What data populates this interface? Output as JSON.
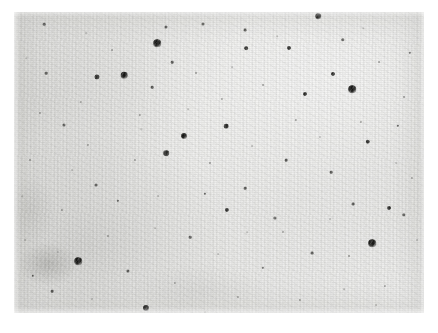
{
  "image": {
    "kind": "astronomical-photographic-plate-scan",
    "width": 438,
    "height": 333,
    "background_color": "#ffffff",
    "caption": ""
  },
  "plate": {
    "label": "photographic plate field",
    "x": 14,
    "y": 12,
    "width": 410,
    "height": 301,
    "base_tone": "#e9e9e7",
    "grain": "fine silver-halide grain",
    "border": "none"
  },
  "diffuse_features": [
    {
      "name": "low-surface-brightness-smudge",
      "cx": 48,
      "cy": 264,
      "rx": 30,
      "ry": 22,
      "tone": "rgba(110,110,105,0.30)"
    },
    {
      "name": "faint-halo-left",
      "cx": 30,
      "cy": 210,
      "rx": 26,
      "ry": 34,
      "tone": "rgba(125,125,120,0.15)"
    },
    {
      "name": "faint-haze-lower-center",
      "cx": 200,
      "cy": 290,
      "rx": 70,
      "ry": 26,
      "tone": "rgba(130,130,125,0.10)"
    }
  ],
  "spots": [
    {
      "x": 157,
      "y": 43,
      "d": 7.5,
      "class": "big"
    },
    {
      "x": 352,
      "y": 89,
      "d": 7.5,
      "class": "big"
    },
    {
      "x": 78,
      "y": 261,
      "d": 7.5,
      "class": "big"
    },
    {
      "x": 372,
      "y": 243,
      "d": 7.5,
      "class": "big"
    },
    {
      "x": 124,
      "y": 75,
      "d": 6.5,
      "class": "big"
    },
    {
      "x": 184,
      "y": 136,
      "d": 6.0,
      "class": "big"
    },
    {
      "x": 146,
      "y": 308,
      "d": 6.0,
      "class": "big"
    },
    {
      "x": 318,
      "y": 16,
      "d": 5.5,
      "class": "big"
    },
    {
      "x": 166,
      "y": 153,
      "d": 5.5,
      "class": "mid"
    },
    {
      "x": 97,
      "y": 77,
      "d": 5.0,
      "class": "mid"
    },
    {
      "x": 226,
      "y": 126,
      "d": 4.6,
      "class": "mid"
    },
    {
      "x": 368,
      "y": 142,
      "d": 4.4,
      "class": "mid"
    },
    {
      "x": 227,
      "y": 210,
      "d": 4.2,
      "class": "mid"
    },
    {
      "x": 289,
      "y": 48,
      "d": 4.0,
      "class": "mid"
    },
    {
      "x": 333,
      "y": 74,
      "d": 4.0,
      "class": "mid"
    },
    {
      "x": 305,
      "y": 94,
      "d": 4.0,
      "class": "mid"
    },
    {
      "x": 389,
      "y": 208,
      "d": 4.0,
      "class": "mid"
    },
    {
      "x": 246,
      "y": 48,
      "d": 3.6,
      "class": "mid"
    },
    {
      "x": 343,
      "y": 40,
      "d": 3.4,
      "class": "small"
    },
    {
      "x": 404,
      "y": 215,
      "d": 3.4,
      "class": "small"
    },
    {
      "x": 275,
      "y": 218,
      "d": 3.2,
      "class": "small"
    },
    {
      "x": 128,
      "y": 271,
      "d": 3.2,
      "class": "small"
    },
    {
      "x": 166,
      "y": 27,
      "d": 3.0,
      "class": "small"
    },
    {
      "x": 203,
      "y": 24,
      "d": 3.0,
      "class": "small"
    },
    {
      "x": 64,
      "y": 125,
      "d": 3.0,
      "class": "small"
    },
    {
      "x": 96,
      "y": 185,
      "d": 3.0,
      "class": "small"
    },
    {
      "x": 245,
      "y": 30,
      "d": 2.8,
      "class": "small"
    },
    {
      "x": 353,
      "y": 204,
      "d": 2.8,
      "class": "small"
    },
    {
      "x": 312,
      "y": 253,
      "d": 2.8,
      "class": "small"
    },
    {
      "x": 44,
      "y": 24,
      "d": 2.6,
      "class": "small"
    },
    {
      "x": 46,
      "y": 73,
      "d": 2.6,
      "class": "small"
    },
    {
      "x": 152,
      "y": 87,
      "d": 2.6,
      "class": "small"
    },
    {
      "x": 172,
      "y": 62,
      "d": 2.6,
      "class": "small"
    },
    {
      "x": 286,
      "y": 160,
      "d": 2.6,
      "class": "small"
    },
    {
      "x": 331,
      "y": 172,
      "d": 2.6,
      "class": "small"
    },
    {
      "x": 245,
      "y": 188,
      "d": 2.6,
      "class": "small"
    },
    {
      "x": 190,
      "y": 237,
      "d": 2.6,
      "class": "small"
    },
    {
      "x": 52,
      "y": 291,
      "d": 2.6,
      "class": "small"
    },
    {
      "x": 33,
      "y": 276,
      "d": 2.4,
      "class": "small"
    },
    {
      "x": 118,
      "y": 201,
      "d": 2.4,
      "class": "small"
    },
    {
      "x": 205,
      "y": 194,
      "d": 2.4,
      "class": "small"
    },
    {
      "x": 263,
      "y": 268,
      "d": 2.4,
      "class": "small"
    },
    {
      "x": 398,
      "y": 126,
      "d": 2.4,
      "class": "small"
    },
    {
      "x": 410,
      "y": 53,
      "d": 2.4,
      "class": "small"
    },
    {
      "x": 361,
      "y": 122,
      "d": 2.2,
      "class": "faint"
    },
    {
      "x": 296,
      "y": 120,
      "d": 2.2,
      "class": "faint"
    },
    {
      "x": 222,
      "y": 99,
      "d": 2.2,
      "class": "faint"
    },
    {
      "x": 140,
      "y": 115,
      "d": 2.2,
      "class": "faint"
    },
    {
      "x": 81,
      "y": 102,
      "d": 2.2,
      "class": "faint"
    },
    {
      "x": 62,
      "y": 210,
      "d": 2.2,
      "class": "faint"
    },
    {
      "x": 108,
      "y": 236,
      "d": 2.2,
      "class": "faint"
    },
    {
      "x": 175,
      "y": 283,
      "d": 2.2,
      "class": "faint"
    },
    {
      "x": 238,
      "y": 297,
      "d": 2.2,
      "class": "faint"
    },
    {
      "x": 300,
      "y": 300,
      "d": 2.2,
      "class": "faint"
    },
    {
      "x": 385,
      "y": 286,
      "d": 2.2,
      "class": "faint"
    },
    {
      "x": 412,
      "y": 178,
      "d": 2.2,
      "class": "faint"
    },
    {
      "x": 349,
      "y": 256,
      "d": 2.0,
      "class": "faint"
    },
    {
      "x": 283,
      "y": 232,
      "d": 2.0,
      "class": "faint"
    },
    {
      "x": 210,
      "y": 163,
      "d": 2.0,
      "class": "faint"
    },
    {
      "x": 135,
      "y": 160,
      "d": 2.0,
      "class": "faint"
    },
    {
      "x": 88,
      "y": 145,
      "d": 2.0,
      "class": "faint"
    },
    {
      "x": 30,
      "y": 160,
      "d": 2.0,
      "class": "faint"
    },
    {
      "x": 40,
      "y": 113,
      "d": 2.0,
      "class": "faint"
    },
    {
      "x": 112,
      "y": 50,
      "d": 2.0,
      "class": "faint"
    },
    {
      "x": 196,
      "y": 73,
      "d": 2.0,
      "class": "faint"
    },
    {
      "x": 263,
      "y": 85,
      "d": 2.0,
      "class": "faint"
    },
    {
      "x": 379,
      "y": 62,
      "d": 2.0,
      "class": "faint"
    },
    {
      "x": 404,
      "y": 97,
      "d": 2.0,
      "class": "faint"
    },
    {
      "x": 320,
      "y": 137,
      "d": 1.8,
      "class": "vfaint"
    },
    {
      "x": 252,
      "y": 146,
      "d": 1.8,
      "class": "vfaint"
    },
    {
      "x": 158,
      "y": 196,
      "d": 1.8,
      "class": "vfaint"
    },
    {
      "x": 72,
      "y": 170,
      "d": 1.8,
      "class": "vfaint"
    },
    {
      "x": 25,
      "y": 240,
      "d": 1.8,
      "class": "vfaint"
    },
    {
      "x": 58,
      "y": 252,
      "d": 1.8,
      "class": "vfaint"
    },
    {
      "x": 92,
      "y": 299,
      "d": 1.8,
      "class": "vfaint"
    },
    {
      "x": 218,
      "y": 254,
      "d": 1.8,
      "class": "vfaint"
    },
    {
      "x": 330,
      "y": 219,
      "d": 1.8,
      "class": "vfaint"
    },
    {
      "x": 396,
      "y": 163,
      "d": 1.8,
      "class": "vfaint"
    },
    {
      "x": 417,
      "y": 240,
      "d": 1.8,
      "class": "vfaint"
    },
    {
      "x": 376,
      "y": 305,
      "d": 1.8,
      "class": "vfaint"
    },
    {
      "x": 141,
      "y": 129,
      "d": 1.6,
      "class": "vfaint"
    },
    {
      "x": 188,
      "y": 109,
      "d": 1.6,
      "class": "vfaint"
    },
    {
      "x": 232,
      "y": 67,
      "d": 1.6,
      "class": "vfaint"
    },
    {
      "x": 277,
      "y": 36,
      "d": 1.6,
      "class": "vfaint"
    },
    {
      "x": 363,
      "y": 28,
      "d": 1.6,
      "class": "vfaint"
    },
    {
      "x": 86,
      "y": 33,
      "d": 1.6,
      "class": "vfaint"
    },
    {
      "x": 26,
      "y": 58,
      "d": 1.6,
      "class": "vfaint"
    },
    {
      "x": 22,
      "y": 196,
      "d": 1.6,
      "class": "vfaint"
    },
    {
      "x": 155,
      "y": 228,
      "d": 1.6,
      "class": "vfaint"
    },
    {
      "x": 247,
      "y": 232,
      "d": 1.6,
      "class": "vfaint"
    },
    {
      "x": 344,
      "y": 289,
      "d": 1.6,
      "class": "vfaint"
    },
    {
      "x": 205,
      "y": 312,
      "d": 1.6,
      "class": "vfaint"
    }
  ]
}
